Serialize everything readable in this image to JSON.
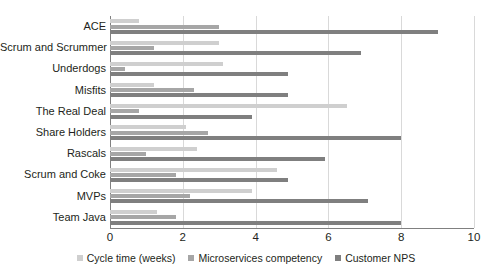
{
  "chart_data": {
    "type": "bar",
    "orientation": "horizontal",
    "title": "",
    "xlabel": "",
    "ylabel": "",
    "xlim": [
      0,
      10
    ],
    "xticks": [
      0,
      2,
      4,
      6,
      8,
      10
    ],
    "grid": true,
    "legend_position": "bottom",
    "categories": [
      "ACE",
      "Scrum and Scrummer",
      "Underdogs",
      "Misfits",
      "The Real Deal",
      "Share Holders",
      "Rascals",
      "Scrum and Coke",
      "MVPs",
      "Team Java"
    ],
    "series": [
      {
        "name": "Cycle time (weeks)",
        "color": "#cfcfcf",
        "values": [
          0.8,
          3.0,
          3.1,
          1.2,
          6.5,
          2.1,
          2.4,
          4.6,
          3.9,
          1.3
        ]
      },
      {
        "name": "Microservices competency",
        "color": "#a6a6a6",
        "values": [
          3.0,
          1.2,
          0.4,
          2.3,
          0.8,
          2.7,
          1.0,
          1.8,
          2.2,
          1.8
        ]
      },
      {
        "name": "Customer NPS",
        "color": "#7f7f7f",
        "values": [
          9.0,
          6.9,
          4.9,
          4.9,
          3.9,
          8.0,
          5.9,
          4.9,
          7.1,
          8.0
        ]
      }
    ]
  },
  "colors": {
    "series_0": "#cfcfcf",
    "series_1": "#a6a6a6",
    "series_2": "#7f7f7f",
    "axis": "#808080",
    "grid": "#d9d9d9",
    "text": "#231f20",
    "background": "#ffffff"
  }
}
